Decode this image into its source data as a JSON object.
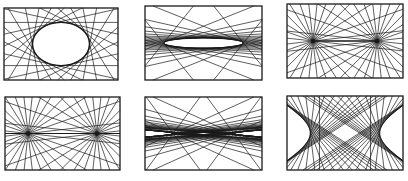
{
  "figure": {
    "stroke_color": "#1a1a1a",
    "background": "#ffffff"
  },
  "panels": [
    {
      "id": "p1",
      "label": "ellipse-envelope",
      "rect": [
        4,
        8,
        114,
        72
      ],
      "kind": "ellipse",
      "rx": 0.25,
      "ry": 0.3,
      "lines": 22
    },
    {
      "id": "p2",
      "label": "flat-ellipse-envelope",
      "rect": [
        145,
        6,
        117,
        74
      ],
      "kind": "ellipse",
      "rx": 0.34,
      "ry": 0.07,
      "lines": 30
    },
    {
      "id": "p3",
      "label": "two-foci-segment",
      "rect": [
        287,
        4,
        116,
        74
      ],
      "kind": "foci",
      "fx": 0.24,
      "lines": 14
    },
    {
      "id": "p4",
      "label": "two-foci-full-line",
      "rect": [
        5,
        97,
        115,
        73
      ],
      "kind": "foci",
      "fx": 0.26,
      "lines": 14
    },
    {
      "id": "p5",
      "label": "flat-hyperbola-envelope",
      "rect": [
        145,
        97,
        117,
        73
      ],
      "kind": "hyper",
      "a": 0.26,
      "b": 0.03,
      "lines": 30
    },
    {
      "id": "p6",
      "label": "hyperbola-envelope",
      "rect": [
        287,
        96,
        116,
        74
      ],
      "kind": "hyper",
      "a": 0.3,
      "b": 0.28,
      "lines": 22
    }
  ]
}
